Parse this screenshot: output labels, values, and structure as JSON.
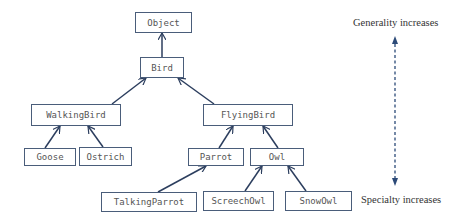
{
  "diagram": {
    "type": "class-hierarchy",
    "nodes": {
      "object": {
        "label": "Object"
      },
      "bird": {
        "label": "Bird"
      },
      "walking_bird": {
        "label": "WalkingBird"
      },
      "flying_bird": {
        "label": "FlyingBird"
      },
      "goose": {
        "label": "Goose"
      },
      "ostrich": {
        "label": "Ostrich"
      },
      "parrot": {
        "label": "Parrot"
      },
      "owl": {
        "label": "Owl"
      },
      "talking_parrot": {
        "label": "TalkingParrot"
      },
      "screech_owl": {
        "label": "ScreechOwl"
      },
      "snow_owl": {
        "label": "SnowOwl"
      }
    },
    "edges": [
      {
        "from": "Bird",
        "to": "Object"
      },
      {
        "from": "WalkingBird",
        "to": "Bird"
      },
      {
        "from": "FlyingBird",
        "to": "Bird"
      },
      {
        "from": "Goose",
        "to": "WalkingBird"
      },
      {
        "from": "Ostrich",
        "to": "WalkingBird"
      },
      {
        "from": "Parrot",
        "to": "FlyingBird"
      },
      {
        "from": "Owl",
        "to": "FlyingBird"
      },
      {
        "from": "TalkingParrot",
        "to": "Parrot"
      },
      {
        "from": "ScreechOwl",
        "to": "Owl"
      },
      {
        "from": "SnowOwl",
        "to": "Owl"
      }
    ],
    "axis": {
      "top_label": "Generality increases",
      "bottom_label": "Specialty increases"
    },
    "colors": {
      "edge": "#2c3e5e",
      "border": "#4a5d7a",
      "node_text": "#555555",
      "axis_arrow": "#2c4a78"
    }
  }
}
